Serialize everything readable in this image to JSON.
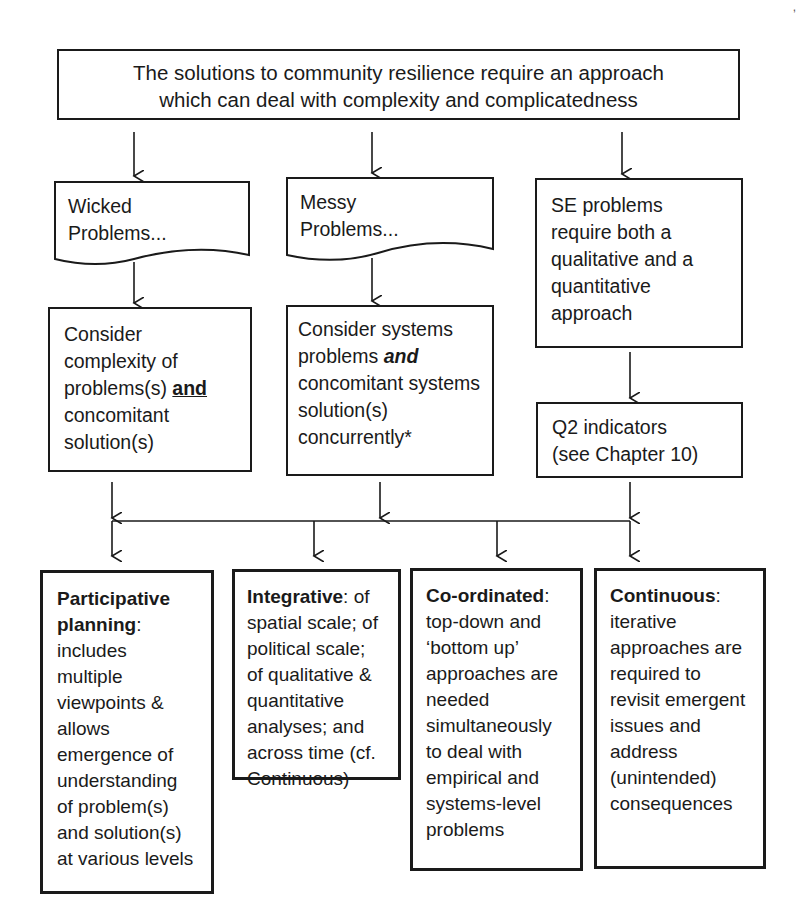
{
  "diagram": {
    "top": {
      "line1": "The solutions to community resilience require an approach",
      "line2": "which can deal with complexity and complicatedness"
    },
    "wicked": {
      "line1": "Wicked",
      "line2": "Problems..."
    },
    "messy": {
      "line1": "Messy",
      "line2": "Problems..."
    },
    "se": {
      "text": "SE problems require both a qualitative and a quantitative approach"
    },
    "consider_left": {
      "pre": "Consider complexity of problems(s) ",
      "emph": "and",
      "post": " concomitant solution(s)"
    },
    "consider_mid": {
      "pre": "Consider systems problems ",
      "emph": "and",
      "post": " concomitant systems solution(s) concurrently*"
    },
    "q2": {
      "line1": "Q2 indicators",
      "line2": "(see Chapter 10)"
    },
    "outcomes": [
      {
        "title": "Participative planning",
        "body": ": includes multiple viewpoints & allows emergence of understanding of problem(s) and solution(s) at various levels"
      },
      {
        "title": "Integrative",
        "body": ": of spatial scale; of political scale; of qualitative & quantitative analyses; and across time (cf. Continuous)"
      },
      {
        "title": "Co-ordinated",
        "body": ": top-down and ‘bottom up’ approaches are needed simultaneously to deal with empirical and systems-level problems"
      },
      {
        "title": "Continuous",
        "body": ": iterative approaches are required to revisit emergent issues and address (unintended) consequences"
      }
    ],
    "colors": {
      "stroke": "#1a1a1a",
      "background": "#ffffff"
    }
  }
}
